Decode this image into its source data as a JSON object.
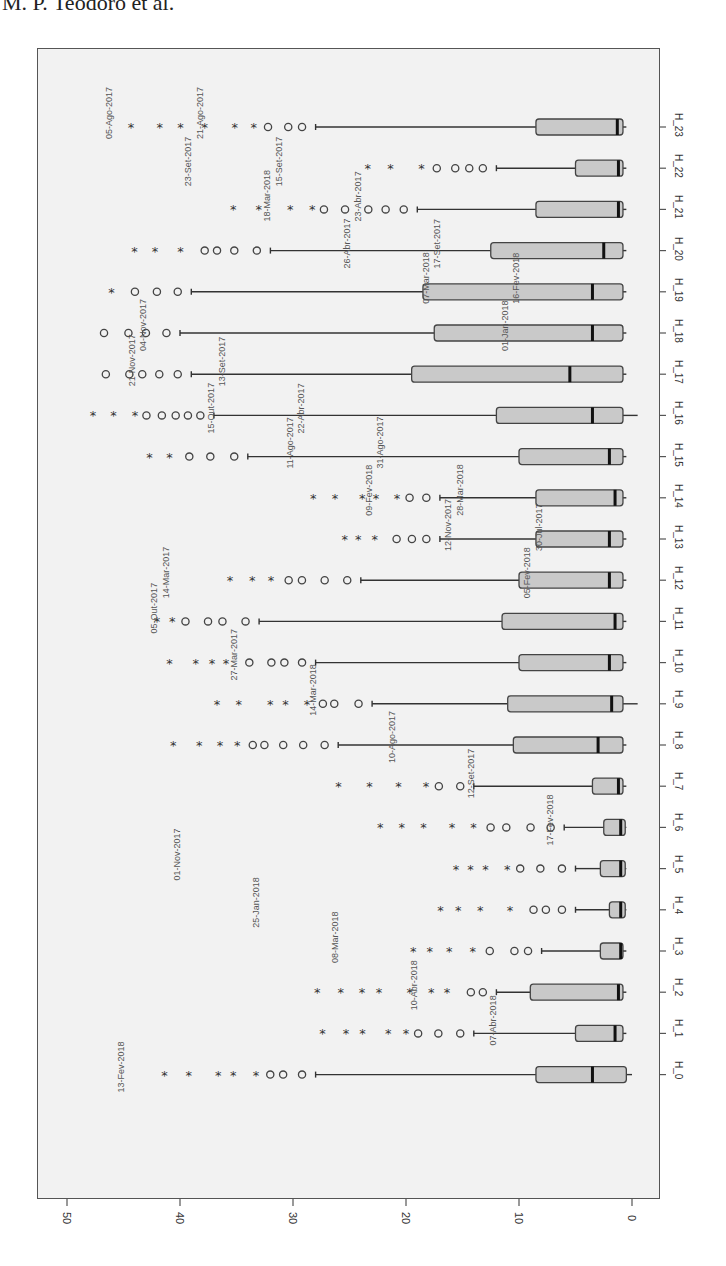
{
  "header": {
    "text": "M. P. Teodoro et al."
  },
  "chart_data": {
    "type": "boxplot",
    "orientation": "rotated 90deg clockwise (value axis along bottom, categories along right side)",
    "title": "",
    "xlabel": "",
    "ylabel": "",
    "value_axis": {
      "ticks": [
        50,
        40,
        30,
        20,
        10,
        0
      ],
      "range": [
        0,
        50
      ]
    },
    "categories": [
      "H_0",
      "H_1",
      "H_2",
      "H_3",
      "H_4",
      "H_5",
      "H_6",
      "H_7",
      "H_8",
      "H_9",
      "H_10",
      "H_11",
      "H_12",
      "H_13",
      "H_14",
      "H_15",
      "H_16",
      "H_17",
      "H_18",
      "H_19",
      "H_20",
      "H_21",
      "H_22",
      "H_23"
    ],
    "boxes": [
      {
        "cat": "H_0",
        "min": 0,
        "q1": 0.5,
        "median": 3.5,
        "q3": 8.5,
        "max": 28
      },
      {
        "cat": "H_1",
        "min": 0.5,
        "q1": 0.8,
        "median": 1.5,
        "q3": 5,
        "max": 14
      },
      {
        "cat": "H_2",
        "min": 0.5,
        "q1": 0.8,
        "median": 1.2,
        "q3": 9,
        "max": 12
      },
      {
        "cat": "H_3",
        "min": 0.5,
        "q1": 0.8,
        "median": 1.0,
        "q3": 2.8,
        "max": 8
      },
      {
        "cat": "H_4",
        "min": 0.5,
        "q1": 0.6,
        "median": 1.0,
        "q3": 2.0,
        "max": 5
      },
      {
        "cat": "H_5",
        "min": 0.5,
        "q1": 0.6,
        "median": 1.0,
        "q3": 2.8,
        "max": 5
      },
      {
        "cat": "H_6",
        "min": 0.5,
        "q1": 0.6,
        "median": 1.0,
        "q3": 2.5,
        "max": 6
      },
      {
        "cat": "H_7",
        "min": 0.5,
        "q1": 0.8,
        "median": 1.2,
        "q3": 3.5,
        "max": 14
      },
      {
        "cat": "H_8",
        "min": 0.5,
        "q1": 0.8,
        "median": 3.0,
        "q3": 10.5,
        "max": 26
      },
      {
        "cat": "H_9",
        "min": -0.5,
        "q1": 0.8,
        "median": 1.8,
        "q3": 11,
        "max": 23
      },
      {
        "cat": "H_10",
        "min": 0.5,
        "q1": 0.8,
        "median": 2.0,
        "q3": 10,
        "max": 28
      },
      {
        "cat": "H_11",
        "min": 0.5,
        "q1": 0.8,
        "median": 1.5,
        "q3": 11.5,
        "max": 33
      },
      {
        "cat": "H_12",
        "min": 0.5,
        "q1": 0.8,
        "median": 2.0,
        "q3": 10,
        "max": 24
      },
      {
        "cat": "H_13",
        "min": 0.5,
        "q1": 0.8,
        "median": 2.0,
        "q3": 8.5,
        "max": 17
      },
      {
        "cat": "H_14",
        "min": 0.5,
        "q1": 0.8,
        "median": 1.5,
        "q3": 8.5,
        "max": 17
      },
      {
        "cat": "H_15",
        "min": 0.5,
        "q1": 0.8,
        "median": 2.0,
        "q3": 10,
        "max": 34
      },
      {
        "cat": "H_16",
        "min": -0.5,
        "q1": 0.8,
        "median": 3.5,
        "q3": 12,
        "max": 37
      },
      {
        "cat": "H_17",
        "min": 0.5,
        "q1": 0.8,
        "median": 5.5,
        "q3": 19.5,
        "max": 39
      },
      {
        "cat": "H_18",
        "min": 0.5,
        "q1": 0.8,
        "median": 3.5,
        "q3": 17.5,
        "max": 40
      },
      {
        "cat": "H_19",
        "min": 0.5,
        "q1": 0.8,
        "median": 3.5,
        "q3": 18.5,
        "max": 39
      },
      {
        "cat": "H_20",
        "min": 0.5,
        "q1": 0.8,
        "median": 2.5,
        "q3": 12.5,
        "max": 32
      },
      {
        "cat": "H_21",
        "min": 0.5,
        "q1": 0.8,
        "median": 1.2,
        "q3": 8.5,
        "max": 19
      },
      {
        "cat": "H_22",
        "min": 0.5,
        "q1": 0.8,
        "median": 1.2,
        "q3": 5.0,
        "max": 12
      },
      {
        "cat": "H_23",
        "min": 0.5,
        "q1": 0.8,
        "median": 1.3,
        "q3": 8.5,
        "max": 28
      }
    ],
    "outlier_markers": {
      "mild": "circle (o)",
      "extreme": "asterisk (*)"
    },
    "outlier_labels_sample": [
      "05-Ago-2017",
      "23-Set-2017",
      "18-Mar-2018",
      "26-Abr-2017",
      "07-Mar-2018",
      "01-Jan-2018",
      "21-Nov-2017",
      "15-Out-2017",
      "11-Ago-2017",
      "09-Fev-2018",
      "12-Nov-2017",
      "05-Fev-2018",
      "05-Out-2017",
      "27-Mar-2017",
      "14-Mar-2018",
      "10-Ago-2017",
      "12-Set-2017",
      "17-Fev-2018",
      "01-Nov-2017",
      "25-Jan-2018",
      "08-Mar-2018",
      "10-Abr-2018",
      "07-Abr-2018",
      "13-Fev-2018",
      "21-Ago-2017",
      "15-Set-2017",
      "23-Abr-2017",
      "17-Set-2017",
      "16-Fev-2018",
      "04-Nov-2017",
      "13-Set-2017",
      "22-Abr-2017",
      "31-Ago-2017",
      "28-Mar-2018",
      "30-Jul-2017",
      "14-Mar-2017"
    ],
    "grid": false,
    "legend": null
  }
}
